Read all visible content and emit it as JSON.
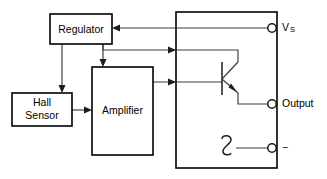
{
  "diagram": {
    "type": "schematic",
    "colors": {
      "background": "#ffffff",
      "block_outline": "#000000",
      "wire": "#3a3a3a",
      "wire_dark": "#1c1c1c",
      "text": "#000000"
    },
    "blocks": [
      {
        "id": "regulator",
        "label": "Regulator",
        "x": 50,
        "y": 14,
        "width": 62,
        "height": 30
      },
      {
        "id": "hall-sensor",
        "label_line1": "Hall",
        "label_line2": "Sensor",
        "x": 12,
        "y": 93,
        "width": 60,
        "height": 33
      },
      {
        "id": "amplifier",
        "label": "Amplifier",
        "x": 92,
        "y": 67,
        "width": 61,
        "height": 88
      }
    ],
    "enclosure": {
      "id": "ic-package-outline",
      "x": 176,
      "y": 12,
      "width": 101,
      "height": 156
    },
    "components": [
      {
        "id": "output-transistor",
        "type": "npn-bipolar-transistor",
        "base_x": 222,
        "base_top": 62,
        "base_bottom": 95
      },
      {
        "id": "wire-hop",
        "type": "wire-crossing-hop",
        "x": 228,
        "y": 148
      }
    ],
    "terminals": [
      {
        "id": "supply",
        "label": "V",
        "subscript": "S",
        "cx": 272,
        "cy": 28
      },
      {
        "id": "output",
        "label": "Output",
        "subscript": "",
        "cx": 272,
        "cy": 104
      },
      {
        "id": "ground",
        "label": "−",
        "subscript": "",
        "cx": 272,
        "cy": 148
      }
    ]
  }
}
